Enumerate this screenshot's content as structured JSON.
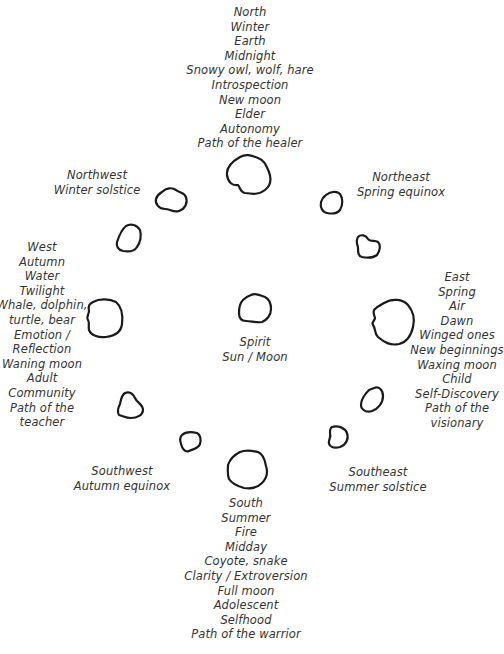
{
  "directions": {
    "north": {
      "lines": [
        "North",
        "Winter",
        "Earth",
        "Midnight",
        "Snowy owl, wolf, hare",
        "Introspection",
        "New moon",
        "Elder",
        "Autonomy",
        "Path of the healer"
      ]
    },
    "northwest": {
      "lines": [
        "Northwest",
        "Winter solstice"
      ]
    },
    "northeast": {
      "lines": [
        "Northeast",
        "Spring equinox"
      ]
    },
    "west": {
      "lines": [
        "West",
        "Autumn",
        "Water",
        "Twilight",
        "Whale, dolphin,",
        "turtle, bear",
        "Emotion /",
        "Reflection",
        "Waning moon",
        "Adult",
        "Community",
        "Path of the",
        "teacher"
      ]
    },
    "center": {
      "lines": [
        "Spirit",
        "Sun / Moon"
      ]
    },
    "east": {
      "lines": [
        "East",
        "Spring",
        "Air",
        "Dawn",
        "Winged ones",
        "New beginnings",
        "Waxing moon",
        "Child",
        "Self-Discovery",
        "Path of the",
        "visionary"
      ]
    },
    "southwest": {
      "lines": [
        "Southwest",
        "Autumn equinox"
      ]
    },
    "southeast": {
      "lines": [
        "Southeast",
        "Summer solstice"
      ]
    },
    "south": {
      "lines": [
        "South",
        "Summer",
        "Fire",
        "Midday",
        "Coyote, snake",
        "Clarity / Extroversion",
        "Full moon",
        "Adolescent",
        "Selfhood",
        "Path of the warrior"
      ]
    }
  },
  "stones": [
    "north",
    "northeast-1",
    "northeast-2",
    "east",
    "southeast-1",
    "southeast-2",
    "south",
    "southwest-1",
    "southwest-2",
    "west",
    "northwest-1",
    "northwest-2",
    "center"
  ],
  "colors": {
    "ink": "#1a1a1a",
    "text": "#333333",
    "background": "#ffffff"
  }
}
